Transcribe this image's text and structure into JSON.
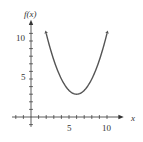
{
  "chart_data": {
    "type": "line",
    "title": "",
    "xlabel": "x",
    "ylabel": "f(x)",
    "xlim": [
      -2,
      11
    ],
    "ylim": [
      -1,
      12
    ],
    "x_ticks": [
      -2,
      -1,
      0,
      1,
      2,
      3,
      4,
      5,
      6,
      7,
      8,
      9,
      10
    ],
    "x_tick_labels": {
      "5": "5",
      "10": "10"
    },
    "y_ticks": [
      -1,
      0,
      1,
      2,
      3,
      4,
      5,
      6,
      7,
      8,
      9,
      10,
      11
    ],
    "y_tick_labels": {
      "5": "5",
      "10": "10"
    },
    "grid": false,
    "series": [
      {
        "name": "f(x)",
        "description": "Upward-opening parabola with arrows at both ends, vertex near (6, 3)",
        "x": [
          2,
          3,
          4,
          5,
          6,
          7,
          8,
          9,
          10
        ],
        "values": [
          11,
          7.5,
          5,
          3.5,
          3,
          3.5,
          5,
          7.5,
          11
        ]
      }
    ],
    "colors": {
      "curve": "#555555",
      "axes": "#333333"
    }
  },
  "labels": {
    "y_axis": "f(x)",
    "x_axis": "x",
    "y_tick_5": "5",
    "y_tick_10": "10",
    "x_tick_5": "5",
    "x_tick_10": "10"
  }
}
